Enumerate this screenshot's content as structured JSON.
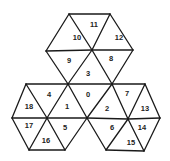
{
  "diagram": {
    "type": "triangular-tiling",
    "line_color": "#1a1a1a",
    "vertices": {
      "A": [
        69,
        14
      ],
      "B": [
        110,
        14
      ],
      "C": [
        46,
        51
      ],
      "D": [
        92,
        50
      ],
      "E": [
        133,
        50
      ],
      "F": [
        26,
        84
      ],
      "G": [
        68,
        84
      ],
      "H": [
        112,
        84
      ],
      "I": [
        145,
        84
      ],
      "J": [
        12,
        118
      ],
      "K": [
        47,
        118
      ],
      "L": [
        87,
        118
      ],
      "M": [
        128,
        119
      ],
      "N": [
        160,
        118
      ],
      "O": [
        29,
        150
      ],
      "P": [
        65,
        150
      ],
      "Q": [
        106,
        150
      ],
      "R": [
        144,
        151
      ]
    },
    "edges": [
      [
        "A",
        "B"
      ],
      [
        "A",
        "C"
      ],
      [
        "B",
        "E"
      ],
      [
        "A",
        "D"
      ],
      [
        "B",
        "D"
      ],
      [
        "C",
        "D"
      ],
      [
        "D",
        "E"
      ],
      [
        "C",
        "G"
      ],
      [
        "E",
        "H"
      ],
      [
        "D",
        "G"
      ],
      [
        "D",
        "H"
      ],
      [
        "F",
        "G"
      ],
      [
        "G",
        "H"
      ],
      [
        "H",
        "I"
      ],
      [
        "F",
        "J"
      ],
      [
        "F",
        "K"
      ],
      [
        "G",
        "K"
      ],
      [
        "G",
        "L"
      ],
      [
        "H",
        "L"
      ],
      [
        "H",
        "M"
      ],
      [
        "I",
        "M"
      ],
      [
        "I",
        "N"
      ],
      [
        "J",
        "K"
      ],
      [
        "K",
        "L"
      ],
      [
        "L",
        "M"
      ],
      [
        "M",
        "N"
      ],
      [
        "J",
        "O"
      ],
      [
        "K",
        "O"
      ],
      [
        "K",
        "P"
      ],
      [
        "L",
        "P"
      ],
      [
        "L",
        "Q"
      ],
      [
        "M",
        "Q"
      ],
      [
        "M",
        "R"
      ],
      [
        "N",
        "R"
      ],
      [
        "O",
        "P"
      ],
      [
        "Q",
        "R"
      ]
    ],
    "triangles": [
      {
        "id": "0",
        "label": "0",
        "x": 88,
        "y": 94
      },
      {
        "id": "1",
        "label": "1",
        "x": 67,
        "y": 106
      },
      {
        "id": "2",
        "label": "2",
        "x": 107,
        "y": 108
      },
      {
        "id": "3",
        "label": "3",
        "x": 88,
        "y": 73
      },
      {
        "id": "4",
        "label": "4",
        "x": 49,
        "y": 94
      },
      {
        "id": "5",
        "label": "5",
        "x": 65,
        "y": 127
      },
      {
        "id": "6",
        "label": "6",
        "x": 112,
        "y": 127
      },
      {
        "id": "7",
        "label": "7",
        "x": 127,
        "y": 93
      },
      {
        "id": "8",
        "label": "8",
        "x": 111,
        "y": 58
      },
      {
        "id": "9",
        "label": "9",
        "x": 69,
        "y": 60
      },
      {
        "id": "10",
        "label": "10",
        "x": 77,
        "y": 37
      },
      {
        "id": "11",
        "label": "11",
        "x": 94,
        "y": 24
      },
      {
        "id": "12",
        "label": "12",
        "x": 119,
        "y": 37
      },
      {
        "id": "13",
        "label": "13",
        "x": 145,
        "y": 108
      },
      {
        "id": "14",
        "label": "14",
        "x": 142,
        "y": 127
      },
      {
        "id": "15",
        "label": "15",
        "x": 131,
        "y": 142
      },
      {
        "id": "16",
        "label": "16",
        "x": 46,
        "y": 140
      },
      {
        "id": "17",
        "label": "17",
        "x": 29,
        "y": 125
      },
      {
        "id": "18",
        "label": "18",
        "x": 29,
        "y": 106
      }
    ]
  }
}
